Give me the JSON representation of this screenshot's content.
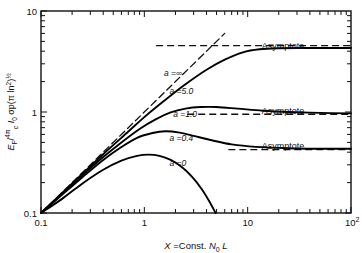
{
  "chart_data": {
    "type": "line",
    "title": "",
    "xlabel": "X = Const. N₀ L",
    "ylabel": "E_F / (4π/c) I₀ σp(π ln2)^½",
    "xscale": "log",
    "yscale": "log",
    "xlim": [
      0.1,
      100
    ],
    "ylim": [
      0.1,
      10
    ],
    "grid": false,
    "legend": "inline-curve-labels",
    "xticks": [
      "0.1",
      "1",
      "10",
      "10²"
    ],
    "xtick_values": [
      0.1,
      1,
      10,
      100
    ],
    "yticks": [
      "0.1",
      "1",
      "10"
    ],
    "ytick_values": [
      0.1,
      1,
      10
    ],
    "annotations": [
      {
        "text": "Asymptote",
        "x": 22,
        "y": 4.2
      },
      {
        "text": "Asymptote",
        "x": 22,
        "y": 0.95
      },
      {
        "text": "Asymptote",
        "x": 22,
        "y": 0.43
      }
    ],
    "series": [
      {
        "name": "a = ∞",
        "label": "a =∞",
        "style": "dashed",
        "color": "#111111",
        "points": [
          [
            0.1,
            0.1
          ],
          [
            0.2,
            0.2
          ],
          [
            0.4,
            0.4
          ],
          [
            0.8,
            0.8
          ],
          [
            1.6,
            1.6
          ],
          [
            3.2,
            3.2
          ],
          [
            5.0,
            5.0
          ],
          [
            6.0,
            6.0
          ]
        ]
      },
      {
        "name": "a = 5.0",
        "label": "a =5.0",
        "style": "solid",
        "color": "#000000",
        "points": [
          [
            0.1,
            0.1
          ],
          [
            0.15,
            0.148
          ],
          [
            0.25,
            0.243
          ],
          [
            0.4,
            0.382
          ],
          [
            0.7,
            0.64
          ],
          [
            1.0,
            0.89
          ],
          [
            1.6,
            1.32
          ],
          [
            2.5,
            1.88
          ],
          [
            4.0,
            2.62
          ],
          [
            6.0,
            3.3
          ],
          [
            9.0,
            3.9
          ],
          [
            13,
            4.18
          ],
          [
            20,
            4.28
          ],
          [
            35,
            4.3
          ],
          [
            60,
            4.3
          ],
          [
            100,
            4.3
          ]
        ]
      },
      {
        "name": "a = 1.0",
        "label": "a =1.0",
        "style": "solid",
        "color": "#000000",
        "points": [
          [
            0.1,
            0.1
          ],
          [
            0.15,
            0.146
          ],
          [
            0.25,
            0.235
          ],
          [
            0.4,
            0.358
          ],
          [
            0.6,
            0.5
          ],
          [
            0.9,
            0.68
          ],
          [
            1.3,
            0.85
          ],
          [
            1.8,
            0.99
          ],
          [
            2.5,
            1.08
          ],
          [
            3.5,
            1.12
          ],
          [
            5.0,
            1.12
          ],
          [
            8.0,
            1.08
          ],
          [
            14,
            1.03
          ],
          [
            25,
            1.0
          ],
          [
            50,
            0.98
          ],
          [
            100,
            0.97
          ]
        ]
      },
      {
        "name": "a = 0.4",
        "label": "a =0.4",
        "style": "solid",
        "color": "#000000",
        "points": [
          [
            0.1,
            0.1
          ],
          [
            0.15,
            0.143
          ],
          [
            0.25,
            0.225
          ],
          [
            0.4,
            0.335
          ],
          [
            0.6,
            0.45
          ],
          [
            0.85,
            0.555
          ],
          [
            1.2,
            0.62
          ],
          [
            1.6,
            0.645
          ],
          [
            2.2,
            0.625
          ],
          [
            3.0,
            0.58
          ],
          [
            4.5,
            0.525
          ],
          [
            7.0,
            0.478
          ],
          [
            12,
            0.452
          ],
          [
            25,
            0.438
          ],
          [
            50,
            0.433
          ],
          [
            100,
            0.432
          ]
        ]
      },
      {
        "name": "a = 0",
        "label": "a =0",
        "style": "solid",
        "color": "#000000",
        "points": [
          [
            0.1,
            0.1
          ],
          [
            0.16,
            0.138
          ],
          [
            0.25,
            0.195
          ],
          [
            0.4,
            0.268
          ],
          [
            0.6,
            0.33
          ],
          [
            0.85,
            0.368
          ],
          [
            1.1,
            0.378
          ],
          [
            1.4,
            0.368
          ],
          [
            1.8,
            0.335
          ],
          [
            2.3,
            0.285
          ],
          [
            2.9,
            0.228
          ],
          [
            3.6,
            0.172
          ],
          [
            4.3,
            0.128
          ],
          [
            4.9,
            0.1
          ]
        ]
      }
    ],
    "asymptote_lines": [
      {
        "for": "a = ∞",
        "y": 4.55,
        "x_from": 1.3,
        "x_to": 100,
        "style": "dashed"
      },
      {
        "for": "a = 1.0",
        "y": 0.95,
        "x_from": 2.6,
        "x_to": 100,
        "style": "dashed"
      },
      {
        "for": "a = 0.4",
        "y": 0.425,
        "x_from": 6.5,
        "x_to": 100,
        "style": "dashed"
      }
    ],
    "curve_labels": [
      {
        "text": "a =∞",
        "x": 1.55,
        "y": 2.25
      },
      {
        "text": "a =5.0",
        "x": 1.75,
        "y": 1.52
      },
      {
        "text": "a =1.0",
        "x": 1.9,
        "y": 0.9
      },
      {
        "text": "a =0.4",
        "x": 1.75,
        "y": 0.52
      },
      {
        "text": "a =0",
        "x": 1.75,
        "y": 0.295
      }
    ]
  }
}
